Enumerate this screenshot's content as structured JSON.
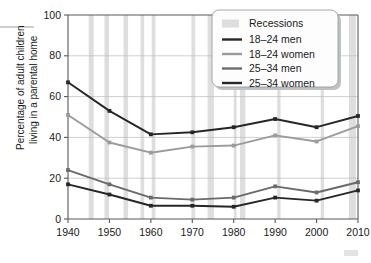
{
  "chart_data": {
    "type": "line",
    "title": "",
    "xlabel": "",
    "ylabel": "Percentage of adult children living in a parental home",
    "ylabel_line1": "Percentage of adult children",
    "ylabel_line2": "living in a parental home",
    "x": [
      1940,
      1950,
      1960,
      1970,
      1980,
      1990,
      2000,
      2010
    ],
    "xtick_labels": [
      "1940",
      "1950",
      "1960",
      "1970",
      "1980",
      "1990",
      "2000",
      "2010"
    ],
    "ytick_labels": [
      "0",
      "20",
      "40",
      "60",
      "80",
      "100"
    ],
    "yticks": [
      0,
      20,
      40,
      60,
      80,
      100
    ],
    "ylim": [
      0,
      100
    ],
    "xlim": [
      1940,
      2010
    ],
    "grid": "horizontal",
    "legend_position": "top-right",
    "series": [
      {
        "name": "18–24 men",
        "color": "#262626",
        "values": [
          67,
          53,
          41.5,
          42.5,
          45,
          49,
          45,
          50.5
        ]
      },
      {
        "name": "18–24 women",
        "color": "#9b9b9b",
        "values": [
          51,
          37.5,
          32.5,
          35.5,
          36,
          41,
          38,
          45.5
        ]
      },
      {
        "name": "25–34 men",
        "color": "#6a6a6a",
        "values": [
          24,
          17,
          10.5,
          9.5,
          10.5,
          16,
          13,
          18
        ]
      },
      {
        "name": "25–34 women",
        "color": "#262626",
        "values": [
          17,
          12,
          6.5,
          6.5,
          6,
          10.5,
          9,
          14
        ]
      }
    ],
    "recessions_label": "Recessions",
    "recessions_color": "#dedede",
    "recession_bands": [
      [
        1945.0,
        1946.2
      ],
      [
        1948.8,
        1949.9
      ],
      [
        1953.4,
        1954.5
      ],
      [
        1957.5,
        1958.4
      ],
      [
        1960.2,
        1961.1
      ],
      [
        1969.8,
        1970.7
      ],
      [
        1973.7,
        1975.2
      ],
      [
        1980.0,
        1980.7
      ],
      [
        1981.5,
        1982.8
      ],
      [
        1990.5,
        1991.3
      ],
      [
        2001.0,
        2001.8
      ],
      [
        2007.8,
        2009.5
      ]
    ]
  }
}
